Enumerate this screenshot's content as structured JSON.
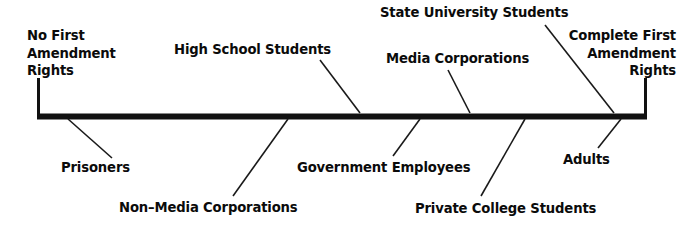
{
  "diagram": {
    "type": "spectrum-continuum",
    "title": "",
    "axis": {
      "orientation": "horizontal",
      "left_cap_label": "No First\nAmendment\nRights",
      "right_cap_label": "Complete First\nAmendment\nRights",
      "line_color": "#111111",
      "line_thickness_px": 6,
      "x_start_px": 37,
      "x_end_px": 647,
      "y_px": 116
    },
    "endpoints": [
      {
        "id": "left-endpoint",
        "label": "No First Amendment Rights",
        "lines": [
          "No First",
          "Amendment",
          "Rights"
        ],
        "align": "left",
        "x_px": 27,
        "y_px": 27
      },
      {
        "id": "right-endpoint",
        "label": "Complete First Amendment Rights",
        "lines": [
          "Complete First",
          "Amendment",
          "Rights"
        ],
        "align": "right",
        "x_px": 676,
        "y_px": 27
      }
    ],
    "markers": [
      {
        "id": "prisoners",
        "label": "Prisoners",
        "side": "below",
        "anchor_x_px": 68,
        "anchor_y_px": 119,
        "label_x_px": 61,
        "label_y_px": 160,
        "leader_end_x_px": 112,
        "leader_end_y_px": 158,
        "align": "left"
      },
      {
        "id": "high-school-students",
        "label": "High School Students",
        "side": "above",
        "anchor_x_px": 360,
        "anchor_y_px": 113,
        "label_x_px": 174,
        "label_y_px": 42,
        "leader_end_x_px": 320,
        "leader_end_y_px": 60,
        "align": "left"
      },
      {
        "id": "non-media-corporations",
        "label": "Non–Media Corporations",
        "side": "below",
        "anchor_x_px": 288,
        "anchor_y_px": 119,
        "label_x_px": 119,
        "label_y_px": 200,
        "leader_end_x_px": 233,
        "leader_end_y_px": 196,
        "align": "left"
      },
      {
        "id": "government-employees",
        "label": "Government Employees",
        "side": "below",
        "anchor_x_px": 420,
        "anchor_y_px": 119,
        "label_x_px": 297,
        "label_y_px": 160,
        "leader_end_x_px": 393,
        "leader_end_y_px": 156,
        "align": "left"
      },
      {
        "id": "media-corporations",
        "label": "Media Corporations",
        "side": "above",
        "anchor_x_px": 470,
        "anchor_y_px": 113,
        "label_x_px": 386,
        "label_y_px": 51,
        "leader_end_x_px": 448,
        "leader_end_y_px": 70,
        "align": "left"
      },
      {
        "id": "private-college-students",
        "label": "Private College Students",
        "side": "below",
        "anchor_x_px": 525,
        "anchor_y_px": 119,
        "label_x_px": 415,
        "label_y_px": 201,
        "leader_end_x_px": 481,
        "leader_end_y_px": 196,
        "align": "left"
      },
      {
        "id": "state-university-students",
        "label": "State University Students",
        "side": "above",
        "anchor_x_px": 614,
        "anchor_y_px": 113,
        "label_x_px": 380,
        "label_y_px": 5,
        "leader_end_x_px": 545,
        "leader_end_y_px": 25,
        "align": "left"
      },
      {
        "id": "adults",
        "label": "Adults",
        "side": "below",
        "anchor_x_px": 621,
        "anchor_y_px": 119,
        "label_x_px": 563,
        "label_y_px": 152,
        "leader_end_x_px": 598,
        "leader_end_y_px": 148,
        "align": "left"
      }
    ],
    "colors": {
      "background": "#ffffff",
      "text": "#0b0b0b",
      "line": "#111111",
      "leader": "#1a1a1a"
    }
  }
}
